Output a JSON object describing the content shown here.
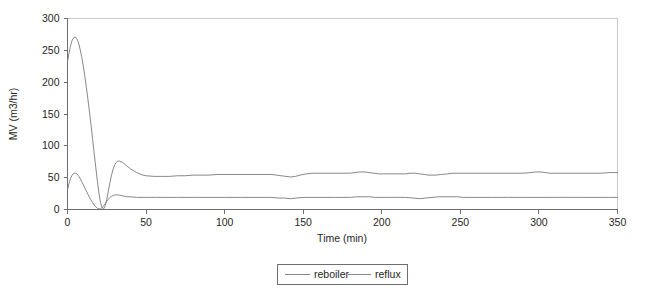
{
  "chart_data": {
    "type": "line",
    "title": "",
    "xlabel": "Time (min)",
    "ylabel": "MV (m3/hr)",
    "xlim": [
      0,
      350
    ],
    "ylim": [
      0,
      300
    ],
    "xticks": [
      0,
      50,
      100,
      150,
      200,
      250,
      300,
      350
    ],
    "yticks": [
      0,
      50,
      100,
      150,
      200,
      250,
      300
    ],
    "xtick_labels": [
      "0",
      "50",
      "100",
      "150",
      "200",
      "250",
      "300",
      "350"
    ],
    "ytick_labels": [
      "0",
      "50",
      "100",
      "150",
      "200",
      "250",
      "300"
    ],
    "grid": false,
    "legend_position": "bottom-center",
    "line_color": "#7a7a7a",
    "axis_color": "#6e6e6e",
    "background": "#ffffff",
    "series": [
      {
        "name": "reboiler",
        "x": [
          0,
          1,
          2,
          3,
          4,
          5,
          6,
          7,
          8,
          9,
          10,
          11,
          12,
          13,
          14,
          15,
          16,
          17,
          18,
          19,
          20,
          21,
          22,
          23,
          24,
          25,
          26,
          27,
          28,
          29,
          30,
          31,
          32,
          33,
          34,
          35,
          36,
          38,
          40,
          42,
          44,
          46,
          48,
          50,
          55,
          60,
          65,
          70,
          75,
          80,
          85,
          90,
          95,
          100,
          105,
          110,
          115,
          120,
          125,
          130,
          133,
          136,
          139,
          142,
          145,
          148,
          152,
          156,
          160,
          165,
          170,
          175,
          180,
          183,
          186,
          189,
          192,
          195,
          198,
          201,
          205,
          210,
          215,
          218,
          221,
          224,
          227,
          230,
          234,
          238,
          242,
          245,
          248,
          251,
          254,
          258,
          262,
          266,
          270,
          275,
          280,
          285,
          290,
          295,
          298,
          301,
          304,
          307,
          310,
          315,
          320,
          325,
          330,
          335,
          340,
          345,
          350
        ],
        "y": [
          232,
          246,
          258,
          266,
          270,
          271,
          268,
          262,
          252,
          240,
          226,
          210,
          192,
          173,
          153,
          132,
          110,
          88,
          66,
          45,
          26,
          11,
          3,
          1,
          6,
          16,
          29,
          42,
          54,
          63,
          70,
          74,
          76,
          76,
          75,
          74,
          72,
          68,
          64,
          61,
          58,
          56,
          54,
          53,
          52,
          52,
          52,
          53,
          53,
          54,
          54,
          54,
          55,
          55,
          55,
          55,
          55,
          55,
          55,
          55,
          54,
          53,
          52,
          51,
          52,
          54,
          56,
          57,
          57,
          57,
          57,
          57,
          57,
          58,
          59,
          59,
          58,
          57,
          56,
          56,
          56,
          56,
          56,
          57,
          57,
          56,
          55,
          54,
          54,
          55,
          56,
          57,
          57,
          57,
          57,
          57,
          57,
          57,
          57,
          57,
          57,
          57,
          57,
          58,
          59,
          59,
          58,
          57,
          57,
          57,
          57,
          57,
          57,
          57,
          57,
          58,
          58
        ]
      },
      {
        "name": "reflux",
        "x": [
          0,
          1,
          2,
          3,
          4,
          5,
          6,
          7,
          8,
          9,
          10,
          11,
          12,
          13,
          14,
          15,
          16,
          17,
          18,
          19,
          20,
          21,
          22,
          23,
          24,
          25,
          26,
          27,
          28,
          29,
          30,
          32,
          34,
          36,
          38,
          40,
          44,
          48,
          52,
          56,
          60,
          70,
          80,
          90,
          100,
          110,
          120,
          130,
          134,
          138,
          142,
          146,
          150,
          155,
          160,
          170,
          180,
          184,
          188,
          192,
          196,
          200,
          205,
          210,
          215,
          220,
          224,
          228,
          232,
          236,
          240,
          245,
          248,
          252,
          256,
          260,
          265,
          270,
          275,
          280,
          285,
          290,
          295,
          300,
          305,
          310,
          315,
          320,
          325,
          330,
          335,
          340,
          345,
          350
        ],
        "y": [
          31,
          41,
          49,
          54,
          57,
          57,
          56,
          53,
          49,
          44,
          39,
          34,
          29,
          24,
          19,
          15,
          11,
          7,
          4,
          2,
          1,
          1,
          3,
          6,
          9,
          13,
          16,
          19,
          21,
          22,
          23,
          23,
          22,
          21,
          20,
          20,
          19,
          19,
          19,
          19,
          19,
          19,
          19,
          19,
          19,
          19,
          19,
          19,
          18,
          18,
          17,
          18,
          19,
          19,
          19,
          19,
          19,
          20,
          20,
          20,
          19,
          19,
          19,
          19,
          19,
          18,
          17,
          18,
          19,
          20,
          20,
          20,
          20,
          19,
          19,
          19,
          19,
          19,
          19,
          19,
          19,
          19,
          19,
          19,
          19,
          19,
          19,
          19,
          19,
          19,
          19,
          19,
          19,
          19
        ]
      }
    ],
    "legend": [
      "reboiler",
      "reflux"
    ]
  },
  "legend": {
    "item_0": "reboiler",
    "item_1": "reflux"
  },
  "axes": {
    "x_title": "Time (min)",
    "y_title": "MV (m3/hr)"
  }
}
